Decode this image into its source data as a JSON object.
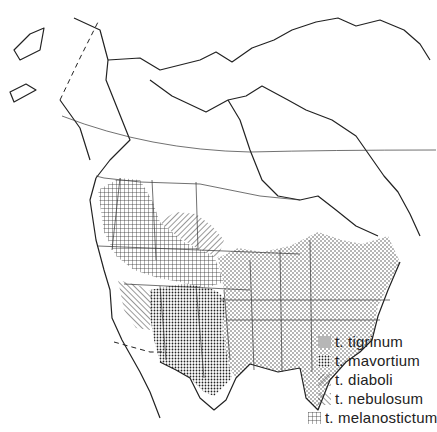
{
  "map": {
    "subject": "Range map of tiger salamander subspecies in North America",
    "style": "black-and-white line map with patterned fills",
    "colors": {
      "line": "#222222",
      "background": "#ffffff"
    }
  },
  "legend": {
    "items": [
      {
        "label": "t. tigrinum",
        "pattern": "fine-dots"
      },
      {
        "label": "t. mavortium",
        "pattern": "dense-crosshatch-dots"
      },
      {
        "label": "t. diaboli",
        "pattern": "diagonal-hatch-right"
      },
      {
        "label": "t. nebulosum",
        "pattern": "diagonal-hatch-left"
      },
      {
        "label": "t. melanostictum",
        "pattern": "grid-crosshatch"
      }
    ]
  }
}
